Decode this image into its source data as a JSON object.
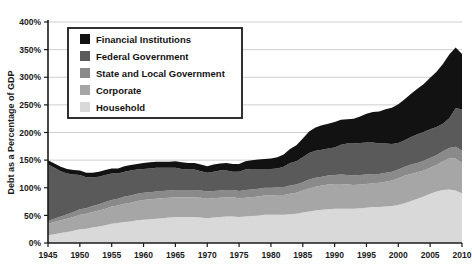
{
  "chart_data": {
    "type": "area",
    "stacked": true,
    "title": "",
    "xlabel": "",
    "ylabel": "Debt as a Percentage of GDP",
    "xlim": [
      1945,
      2010
    ],
    "ylim": [
      0,
      400
    ],
    "ytick_labels": [
      "0%",
      "50%",
      "100%",
      "150%",
      "200%",
      "250%",
      "300%",
      "350%",
      "400%"
    ],
    "ytick_values": [
      0,
      50,
      100,
      150,
      200,
      250,
      300,
      350,
      400
    ],
    "xtick_labels": [
      "1945",
      "1950",
      "1955",
      "1960",
      "1965",
      "1970",
      "1975",
      "1980",
      "1985",
      "1990",
      "1995",
      "2000",
      "2005",
      "2010"
    ],
    "xtick_values": [
      1945,
      1950,
      1955,
      1960,
      1965,
      1970,
      1975,
      1980,
      1985,
      1990,
      1995,
      2000,
      2005,
      2010
    ],
    "grid": true,
    "legend_position": "upper-left-inside",
    "x": [
      1945,
      1946,
      1947,
      1948,
      1949,
      1950,
      1951,
      1952,
      1953,
      1954,
      1955,
      1956,
      1957,
      1958,
      1959,
      1960,
      1961,
      1962,
      1963,
      1964,
      1965,
      1966,
      1967,
      1968,
      1969,
      1970,
      1971,
      1972,
      1973,
      1974,
      1975,
      1976,
      1977,
      1978,
      1979,
      1980,
      1981,
      1982,
      1983,
      1984,
      1985,
      1986,
      1987,
      1988,
      1989,
      1990,
      1991,
      1992,
      1993,
      1994,
      1995,
      1996,
      1997,
      1998,
      1999,
      2000,
      2001,
      2002,
      2003,
      2004,
      2005,
      2006,
      2007,
      2008,
      2009,
      2010
    ],
    "series": [
      {
        "name": "Household",
        "color": "#d9d9d9",
        "values": [
          14,
          16,
          18,
          20,
          22,
          25,
          26,
          28,
          30,
          32,
          35,
          36,
          38,
          39,
          41,
          42,
          43,
          44,
          45,
          46,
          47,
          47,
          47,
          47,
          46,
          45,
          46,
          47,
          48,
          48,
          47,
          48,
          49,
          50,
          51,
          51,
          51,
          51,
          52,
          53,
          55,
          57,
          59,
          60,
          61,
          62,
          62,
          62,
          62,
          63,
          64,
          65,
          65,
          66,
          67,
          69,
          72,
          76,
          80,
          84,
          89,
          93,
          96,
          97,
          95,
          90
        ]
      },
      {
        "name": "Corporate",
        "color": "#a6a6a6",
        "values": [
          21,
          22,
          23,
          24,
          25,
          26,
          27,
          28,
          29,
          30,
          31,
          32,
          33,
          34,
          35,
          36,
          36,
          36,
          36,
          36,
          36,
          36,
          36,
          36,
          36,
          35,
          35,
          35,
          35,
          35,
          34,
          34,
          34,
          34,
          35,
          35,
          36,
          36,
          37,
          38,
          40,
          42,
          43,
          44,
          45,
          45,
          45,
          44,
          43,
          43,
          43,
          43,
          44,
          45,
          46,
          48,
          50,
          49,
          48,
          47,
          47,
          48,
          52,
          56,
          58,
          55
        ]
      },
      {
        "name": "State and Local Government",
        "color": "#8a8a8a",
        "values": [
          5,
          6,
          7,
          8,
          9,
          10,
          10,
          11,
          11,
          12,
          12,
          12,
          13,
          13,
          13,
          13,
          13,
          13,
          13,
          13,
          13,
          13,
          13,
          13,
          13,
          13,
          13,
          13,
          13,
          13,
          13,
          14,
          14,
          14,
          14,
          14,
          14,
          14,
          15,
          15,
          15,
          16,
          16,
          16,
          16,
          16,
          17,
          17,
          17,
          17,
          17,
          17,
          16,
          16,
          16,
          16,
          16,
          17,
          17,
          18,
          18,
          18,
          18,
          19,
          21,
          22
        ]
      },
      {
        "name": "Federal Government",
        "color": "#5a5a5a",
        "values": [
          102,
          92,
          82,
          74,
          68,
          62,
          56,
          52,
          50,
          49,
          48,
          46,
          45,
          45,
          44,
          43,
          43,
          43,
          42,
          41,
          40,
          38,
          37,
          37,
          35,
          34,
          35,
          36,
          35,
          33,
          35,
          37,
          37,
          36,
          34,
          34,
          34,
          37,
          41,
          42,
          45,
          48,
          49,
          49,
          49,
          50,
          54,
          57,
          58,
          58,
          58,
          57,
          55,
          53,
          50,
          48,
          48,
          50,
          52,
          52,
          52,
          51,
          50,
          54,
          70,
          75
        ]
      },
      {
        "name": "Financial Institutions",
        "color": "#121212",
        "values": [
          8,
          8,
          8,
          8,
          8,
          8,
          8,
          8,
          9,
          9,
          9,
          9,
          10,
          10,
          10,
          11,
          11,
          11,
          11,
          11,
          12,
          12,
          12,
          12,
          12,
          12,
          13,
          13,
          14,
          14,
          14,
          15,
          16,
          17,
          18,
          19,
          20,
          22,
          25,
          29,
          34,
          39,
          42,
          44,
          45,
          46,
          45,
          44,
          45,
          48,
          52,
          55,
          58,
          62,
          66,
          70,
          74,
          78,
          82,
          87,
          93,
          100,
          108,
          115,
          110,
          100
        ]
      }
    ],
    "totals_note": ""
  },
  "legend": {
    "items": [
      {
        "label": "Financial Institutions",
        "color": "#121212"
      },
      {
        "label": "Federal Government",
        "color": "#5a5a5a"
      },
      {
        "label": "State and Local Government",
        "color": "#8a8a8a"
      },
      {
        "label": "Corporate",
        "color": "#a6a6a6"
      },
      {
        "label": "Household",
        "color": "#d9d9d9"
      }
    ]
  },
  "style": {
    "background": "#ffffff",
    "grid_color": "#c8c8c8",
    "axis_color": "#1a1a1a",
    "legend_border": "#1a1a1a"
  }
}
